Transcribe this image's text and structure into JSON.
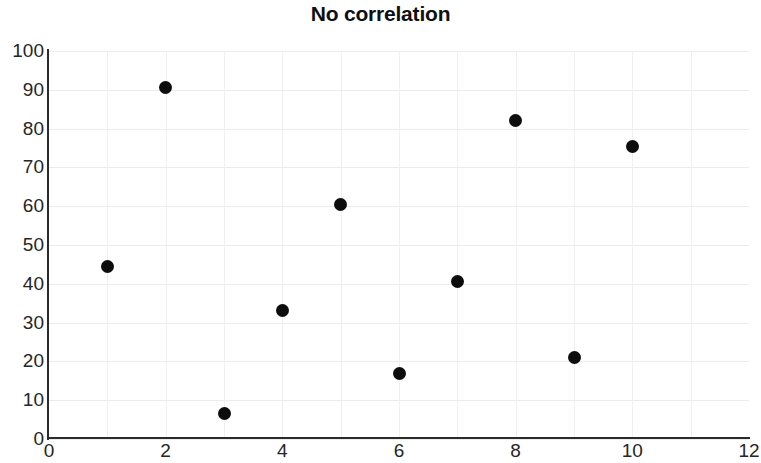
{
  "chart_data": {
    "type": "scatter",
    "title": "No correlation",
    "xlabel": "",
    "ylabel": "",
    "xlim": [
      0,
      12
    ],
    "ylim": [
      0,
      100
    ],
    "grid": true,
    "legend": null,
    "x_ticks": [
      0,
      2,
      4,
      6,
      8,
      10,
      12
    ],
    "x_tick_labels": [
      "0",
      "2",
      "4",
      "6",
      "8",
      "10",
      "12"
    ],
    "y_ticks": [
      0,
      10,
      20,
      30,
      40,
      50,
      60,
      70,
      80,
      90,
      100
    ],
    "y_tick_labels": [
      "0",
      "10",
      "20",
      "30",
      "40",
      "50",
      "60",
      "70",
      "80",
      "90",
      "100"
    ],
    "x": [
      1,
      2,
      3,
      4,
      5,
      6,
      7,
      8,
      9,
      10
    ],
    "y": [
      44.5,
      90.5,
      6.5,
      33,
      60.5,
      17,
      40.5,
      82,
      21,
      75.5
    ],
    "points": [
      {
        "x": 1,
        "y": 44.5
      },
      {
        "x": 2,
        "y": 90.5
      },
      {
        "x": 3,
        "y": 6.5
      },
      {
        "x": 4,
        "y": 33
      },
      {
        "x": 5,
        "y": 60.5
      },
      {
        "x": 6,
        "y": 17
      },
      {
        "x": 7,
        "y": 40.5
      },
      {
        "x": 8,
        "y": 82
      },
      {
        "x": 9,
        "y": 21
      },
      {
        "x": 10,
        "y": 75.5
      }
    ],
    "marker_color": "#0d0d0d",
    "marker_shape": "circle",
    "axis_color": "#2b2b2b",
    "grid_color": "#ececec",
    "background_color": "#ffffff"
  }
}
